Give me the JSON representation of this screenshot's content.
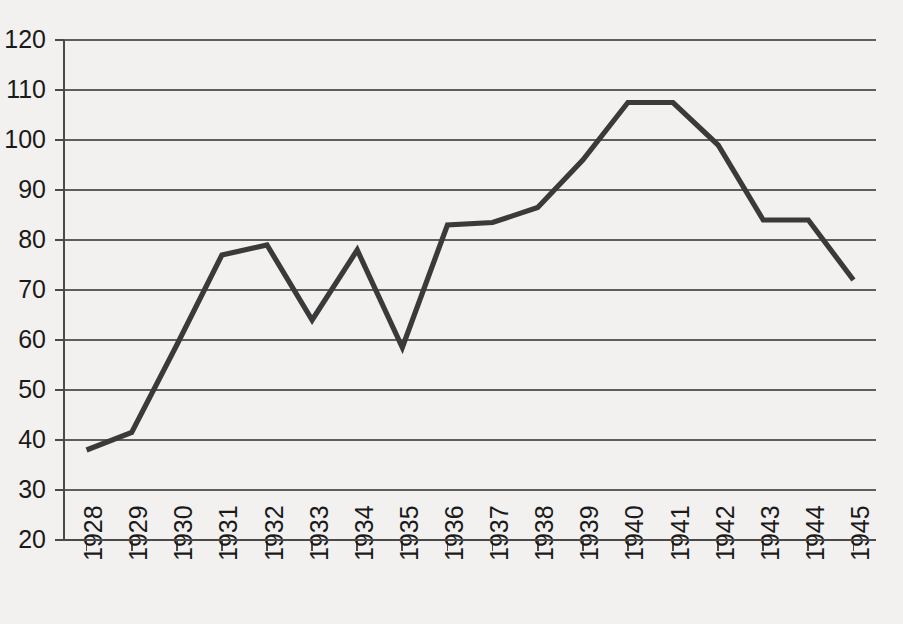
{
  "chart_data": {
    "type": "line",
    "title": "",
    "subtitle": "",
    "xlabel": "",
    "ylabel": "",
    "categories": [
      "1928",
      "1929",
      "1930",
      "1931",
      "1932",
      "1933",
      "1934",
      "1935",
      "1936",
      "1937",
      "1938",
      "1939",
      "1940",
      "1941",
      "1942",
      "1943",
      "1944",
      "1945"
    ],
    "values": [
      38,
      41.5,
      59,
      77,
      79,
      64,
      78,
      58.5,
      83,
      83.5,
      86.5,
      96,
      107.5,
      107.5,
      99,
      84,
      84,
      72
    ],
    "series": [
      {
        "name": "series-1",
        "values": [
          38,
          41.5,
          59,
          77,
          79,
          64,
          78,
          58.5,
          83,
          83.5,
          86.5,
          96,
          107.5,
          107.5,
          99,
          84,
          84,
          72
        ]
      }
    ],
    "ylim": [
      20,
      120
    ],
    "xlim": [
      "1928",
      "1945"
    ],
    "yticks": [
      20,
      30,
      40,
      50,
      60,
      70,
      80,
      90,
      100,
      110,
      120
    ],
    "ytick_labels": [
      "20",
      "30",
      "40",
      "50",
      "60",
      "70",
      "80",
      "90",
      "100",
      "110",
      "120"
    ],
    "xtick_labels": [
      "1928",
      "1929",
      "1930",
      "1931",
      "1932",
      "1933",
      "1934",
      "1935",
      "1936",
      "1937",
      "1938",
      "1939",
      "1940",
      "1941",
      "1942",
      "1943",
      "1944",
      "1945"
    ],
    "xtick_label_rotation": -90,
    "grid": true,
    "grid_axis": "y",
    "legend": false,
    "legend_position": "none",
    "line_color": "#3a3a3a",
    "grid_color": "#5e5e5e",
    "background_color": "#f2f1ef",
    "annotations": []
  },
  "plot_geometry": {
    "left": 64,
    "right": 876,
    "top": 40,
    "bottom": 540
  }
}
